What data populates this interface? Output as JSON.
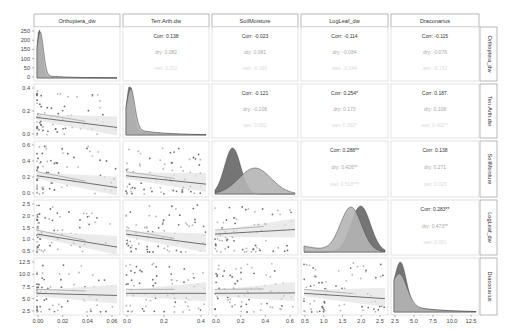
{
  "chart_data": {
    "type": "pairs_matrix",
    "title": "",
    "variables": [
      "Orthoptera_dw",
      "Terr.Arth.dw",
      "SoilMoisture",
      "LogLeaf_dw",
      "Draconarius"
    ],
    "groups": [
      "dry",
      "wet"
    ],
    "colors": {
      "dry": "#6e6e6e",
      "wet": "#b5b5b5",
      "overall": "#555555"
    },
    "axes": {
      "Orthoptera_dw": {
        "ticks": [
          "0.00",
          "0.02",
          "0.04",
          "0.06"
        ],
        "range": [
          0,
          0.072
        ],
        "diag_ticks": [
          "0",
          "50",
          "100",
          "150",
          "200",
          "250"
        ]
      },
      "Terr.Arth.dw": {
        "ticks": [
          "0.0",
          "0.2",
          "0.4"
        ],
        "range": [
          0,
          0.55
        ],
        "yticks": [
          "0.0",
          "0.2",
          "0.4"
        ]
      },
      "SoilMoisture": {
        "ticks": [
          "0.0",
          "0.2",
          "0.4",
          "0.6"
        ],
        "range": [
          0,
          0.65
        ],
        "yticks": [
          "0.0",
          "0.2",
          "0.4",
          "0.6"
        ]
      },
      "LogLeaf_dw": {
        "ticks": [
          "0.5",
          "1.0",
          "1.5",
          "2.0",
          "2.5"
        ],
        "range": [
          0.5,
          3.0
        ],
        "yticks": [
          "0.5",
          "1.0",
          "1.5",
          "2.0",
          "2.5"
        ]
      },
      "Draconarius": {
        "ticks": [
          "2.5",
          "5.0",
          "7.5",
          "10.0",
          "12.5"
        ],
        "range": [
          0.5,
          12.8
        ],
        "yticks": [
          "2.5",
          "5.0",
          "7.5",
          "10.0",
          "12.5"
        ]
      }
    },
    "correlations": [
      {
        "row": "Orthoptera_dw",
        "col": "Terr.Arth.dw",
        "corr": "Corr: 0.138",
        "dry": "dry: 0.082",
        "wet": "wet: 0.202"
      },
      {
        "row": "Orthoptera_dw",
        "col": "SoilMoisture",
        "corr": "Corr: -0.023",
        "dry": "dry: 0.081",
        "wet": "wet: -0.180"
      },
      {
        "row": "Orthoptera_dw",
        "col": "LogLeaf_dw",
        "corr": "Corr: -0.114",
        "dry": "dry: -0.084",
        "wet": "wet: -0.244"
      },
      {
        "row": "Orthoptera_dw",
        "col": "Draconarius",
        "corr": "Corr: -0.115",
        "dry": "dry: -0.076",
        "wet": "wet: -0.152"
      },
      {
        "row": "Terr.Arth.dw",
        "col": "SoilMoisture",
        "corr": "Corr: -0.121",
        "dry": "dry: -0.106",
        "wet": "wet: 0.082"
      },
      {
        "row": "Terr.Arth.dw",
        "col": "LogLeaf_dw",
        "corr": "Corr: 0.254*",
        "dry": "dry: 0.173",
        "wet": "wet: 0.360*"
      },
      {
        "row": "Terr.Arth.dw",
        "col": "Draconarius",
        "corr": "Corr: 0.187.",
        "dry": "dry: 0.108",
        "wet": "wet: 0.402**"
      },
      {
        "row": "SoilMoisture",
        "col": "LogLeaf_dw",
        "corr": "Corr: 0.288**",
        "dry": "dry: 0.426**",
        "wet": "wet: 0.518***"
      },
      {
        "row": "SoilMoisture",
        "col": "Draconarius",
        "corr": "Corr: 0.138",
        "dry": "dry: 0.271",
        "wet": "wet: 0.023"
      },
      {
        "row": "LogLeaf_dw",
        "col": "Draconarius",
        "corr": "Corr: 0.283**",
        "dry": "dry: 0.473**",
        "wet": "wet: 0.091"
      }
    ],
    "grid": false,
    "legend": "none"
  }
}
